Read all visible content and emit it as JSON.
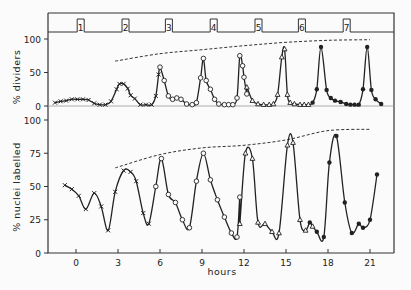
{
  "chart_data": [
    {
      "type": "line",
      "panel": "top",
      "title": "",
      "xlabel": "hours",
      "ylabel": "% dividers",
      "ylim": [
        0,
        100
      ],
      "yticks": [
        0,
        50,
        100
      ],
      "xticks": [
        0,
        3,
        6,
        9,
        12,
        15,
        18,
        21
      ],
      "xlim": [
        -2,
        23
      ],
      "grid": false,
      "pulse_markers": {
        "labels": [
          "1",
          "2",
          "3",
          "4",
          "5",
          "6",
          "7"
        ],
        "x": [
          0.3,
          3.5,
          6.6,
          9.8,
          13.0,
          16.1,
          19.3
        ]
      },
      "envelope_dashed": {
        "x": [
          2.8,
          6,
          9,
          12,
          15,
          18,
          21
        ],
        "y": [
          67,
          78,
          84,
          90,
          95,
          98,
          99
        ]
      },
      "series": [
        {
          "name": "cycle 1 (x)",
          "marker": "x",
          "x": [
            -1.5,
            -1.1,
            -0.7,
            -0.3,
            0.1,
            0.5,
            0.9,
            1.3,
            1.7,
            2.1,
            2.5,
            2.9,
            3.1,
            3.4,
            3.7,
            3.9,
            4.2,
            4.6,
            5.0,
            5.4,
            5.7,
            5.9
          ],
          "y": [
            5,
            7,
            8,
            10,
            10,
            10,
            9,
            4,
            2,
            2,
            7,
            25,
            33,
            33,
            26,
            16,
            11,
            2,
            2,
            2,
            15,
            47
          ]
        },
        {
          "name": "cycle 2-3 (o)",
          "marker": "o",
          "x": [
            6.0,
            6.3,
            6.6,
            6.9,
            7.2,
            7.5,
            7.9,
            8.3,
            8.6,
            8.9,
            9.1,
            9.3,
            9.6,
            9.9,
            10.2,
            10.6,
            10.9,
            11.2,
            11.5,
            11.7,
            11.9,
            12.0,
            12.2
          ],
          "y": [
            58,
            38,
            15,
            10,
            12,
            10,
            3,
            2,
            5,
            42,
            71,
            38,
            25,
            10,
            3,
            2,
            2,
            2,
            12,
            75,
            60,
            43,
            18
          ]
        },
        {
          "name": "cycle 4-5 (triangle)",
          "marker": "triangle",
          "x": [
            12.2,
            12.6,
            13.0,
            13.4,
            13.8,
            14.1,
            14.4,
            14.7,
            14.9,
            15.1,
            15.3,
            15.6,
            16.0,
            16.3,
            16.6
          ],
          "y": [
            28,
            8,
            3,
            2,
            2,
            3,
            17,
            73,
            85,
            17,
            5,
            3,
            2,
            2,
            2
          ]
        },
        {
          "name": "cycle 6-7 (filled)",
          "marker": "filled",
          "x": [
            16.9,
            17.2,
            17.5,
            17.9,
            18.2,
            18.5,
            18.9,
            19.3,
            19.6,
            19.9,
            20.2,
            20.5,
            20.8,
            21.1,
            21.4,
            21.8
          ],
          "y": [
            5,
            25,
            88,
            24,
            12,
            8,
            6,
            3,
            2,
            2,
            2,
            25,
            88,
            24,
            10,
            3
          ]
        }
      ]
    },
    {
      "type": "line",
      "panel": "bottom",
      "title": "",
      "xlabel": "hours",
      "ylabel": "% nuclei labelled",
      "ylim": [
        0,
        100
      ],
      "yticks": [
        0,
        25,
        50,
        75,
        100
      ],
      "xticks": [
        0,
        3,
        6,
        9,
        12,
        15,
        18,
        21
      ],
      "xlim": [
        -2,
        23
      ],
      "grid": false,
      "envelope_dashed": {
        "x": [
          2.8,
          6,
          9,
          12,
          15,
          18,
          21
        ],
        "y": [
          64,
          74,
          79,
          81,
          85,
          92,
          93
        ]
      },
      "series": [
        {
          "name": "x markers",
          "marker": "x",
          "x": [
            -0.8,
            -0.3,
            0.2,
            0.7,
            1.3,
            1.8,
            2.3,
            2.8,
            3.4,
            3.9,
            4.3,
            4.8,
            5.2
          ],
          "y": [
            51,
            48,
            43,
            33,
            45,
            35,
            17,
            46,
            62,
            61,
            54,
            30,
            22
          ]
        },
        {
          "name": "o markers",
          "marker": "o",
          "x": [
            5.7,
            6.1,
            6.6,
            7.1,
            7.6,
            8.1,
            8.6,
            9.1,
            9.6,
            10.1,
            10.6,
            11.1,
            11.5,
            11.7
          ],
          "y": [
            50,
            71,
            44,
            38,
            25,
            19,
            54,
            75,
            55,
            40,
            27,
            15,
            12,
            42
          ]
        },
        {
          "name": "triangle markers",
          "marker": "triangle",
          "x": [
            11.7,
            12.1,
            12.6,
            13.0,
            13.5,
            14.0,
            14.5,
            15.1,
            15.5,
            16.0,
            16.4,
            16.9
          ],
          "y": [
            22,
            75,
            71,
            23,
            22,
            16,
            15,
            81,
            83,
            25,
            17,
            20
          ]
        },
        {
          "name": "filled markers",
          "marker": "filled",
          "x": [
            16.7,
            17.2,
            17.7,
            18.1,
            18.6,
            19.2,
            19.7,
            20.2,
            20.5,
            21.0,
            21.5
          ],
          "y": [
            23,
            16,
            12,
            68,
            88,
            38,
            15,
            22,
            19,
            25,
            59
          ]
        }
      ]
    }
  ],
  "labels": {
    "top_ylabel": "% dividers",
    "bottom_ylabel": "% nuclei labelled",
    "xlabel": "hours"
  }
}
